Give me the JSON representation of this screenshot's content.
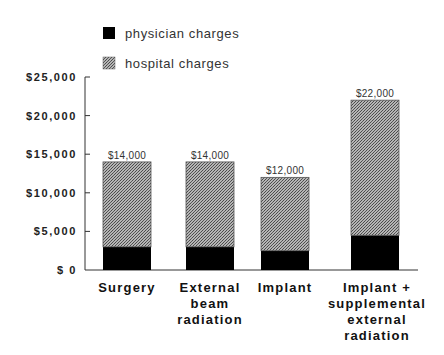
{
  "chart_data": {
    "type": "bar",
    "stacked": true,
    "title": "",
    "xlabel": "",
    "ylabel": "",
    "categories": [
      [
        "Surgery"
      ],
      [
        "External",
        "beam",
        "radiation"
      ],
      [
        "Implant"
      ],
      [
        "Implant +",
        "supplemental",
        "external",
        "radiation"
      ]
    ],
    "series": [
      {
        "name": "physician charges",
        "values": [
          3000,
          3000,
          2500,
          4500
        ],
        "color": "#000000",
        "pattern": "solid"
      },
      {
        "name": "hospital charges",
        "values": [
          11000,
          11000,
          9500,
          17500
        ],
        "color": "#8c8c8c",
        "pattern": "stipple"
      }
    ],
    "totals": [
      14000,
      14000,
      12000,
      22000
    ],
    "total_labels": [
      "$14,000",
      "$14,000",
      "$12,000",
      "$22,000"
    ],
    "ylim": [
      0,
      25000
    ],
    "yticks": [
      0,
      5000,
      10000,
      15000,
      20000,
      25000
    ],
    "ytick_labels": [
      "$ 0",
      "$5,000",
      "$10,000",
      "$15,000",
      "$20,000",
      "$25,000"
    ],
    "grid": false,
    "legend_position": "top-left"
  }
}
